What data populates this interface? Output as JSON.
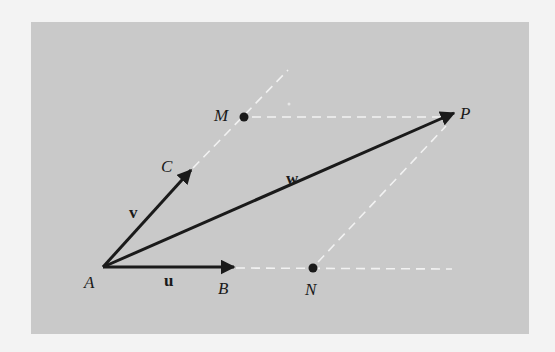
{
  "diagram": {
    "colors": {
      "background": "#c9c9c9",
      "page": "#f3f3f3",
      "vector": "#1a1a1a",
      "dashed": "#f2f2f2"
    },
    "points": {
      "A": {
        "label": "A",
        "x": 103,
        "y": 267
      },
      "B": {
        "label": "B",
        "x": 234,
        "y": 267
      },
      "C": {
        "label": "C",
        "x": 191,
        "y": 170
      },
      "M": {
        "label": "M",
        "x": 244,
        "y": 117
      },
      "N": {
        "label": "N",
        "x": 313,
        "y": 268
      },
      "P": {
        "label": "P",
        "x": 454,
        "y": 113
      }
    },
    "vectors": [
      {
        "name": "u",
        "label": "u",
        "from": "A",
        "to": "B"
      },
      {
        "name": "v",
        "label": "v",
        "from": "A",
        "to": "C"
      },
      {
        "name": "w",
        "label": "w",
        "from": "A",
        "to": "P"
      }
    ],
    "dashed_lines": [
      {
        "from": "B",
        "to": "end-bottom"
      },
      {
        "from": "C",
        "to": "M-extended"
      },
      {
        "from": "M",
        "to": "P"
      },
      {
        "from": "N",
        "to": "P"
      }
    ]
  }
}
